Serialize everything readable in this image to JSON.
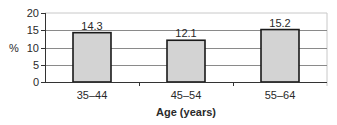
{
  "chart_data": {
    "type": "bar",
    "title": "",
    "xlabel": "Age (years)",
    "ylabel": "%",
    "categories": [
      "35–44",
      "45–54",
      "55–64"
    ],
    "values": [
      14.3,
      12.1,
      15.2
    ],
    "data_labels": [
      "14.3",
      "12.1",
      "15.2"
    ],
    "ylim": [
      0,
      20
    ],
    "yticks": [
      0,
      5,
      10,
      15,
      20
    ],
    "ytick_labels": [
      "0",
      "5",
      "10",
      "15",
      "20"
    ],
    "grid": true,
    "legend": null,
    "colors": {
      "bar_fill": "#d3d3d3",
      "bar_stroke": "#1a1a1a",
      "grid": "#8a8a8a",
      "axis": "#333333",
      "plot_border": "#c8c8c8"
    }
  }
}
